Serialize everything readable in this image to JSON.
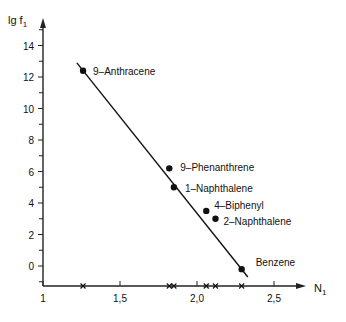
{
  "chart_data": {
    "type": "scatter",
    "title": "",
    "xlabel": "N₁",
    "ylabel": "lg f₁",
    "xlim": [
      1,
      2.75
    ],
    "ylim": [
      -1.3,
      15.5
    ],
    "grid": false,
    "legend": null,
    "x_ticks": [
      "1",
      "1,5",
      "2,0",
      "2,5"
    ],
    "y_ticks": [
      "0",
      "2",
      "4",
      "6",
      "8",
      "10",
      "12",
      "14"
    ],
    "series": [
      {
        "name": "compounds",
        "points": [
          {
            "label": "9–Anthracene",
            "x": 1.26,
            "y": 12.4
          },
          {
            "label": "9–Phenanthrene",
            "x": 1.82,
            "y": 6.2
          },
          {
            "label": "1–Naphthalene",
            "x": 1.85,
            "y": 5.0
          },
          {
            "label": "4–Biphenyl",
            "x": 2.06,
            "y": 3.5
          },
          {
            "label": "2–Naphthalene",
            "x": 2.12,
            "y": 3.0
          },
          {
            "label": "Benzene",
            "x": 2.29,
            "y": -0.2
          }
        ]
      }
    ],
    "fit_line": {
      "x1": 1.22,
      "y1": 12.9,
      "x2": 2.33,
      "y2": -0.7
    },
    "x_axis_marks": [
      1.26,
      1.82,
      1.85,
      2.06,
      2.12,
      2.29
    ]
  },
  "axes": {
    "y_title": "lg f",
    "y_title_sub": "1",
    "x_title": "N",
    "x_title_sub": "1"
  }
}
